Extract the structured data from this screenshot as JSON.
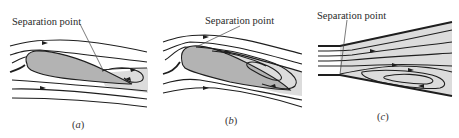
{
  "figure": {
    "panels": [
      {
        "id": "a",
        "annotation": "Separation point",
        "caption_open": "(",
        "caption_letter": "a",
        "caption_close": ")"
      },
      {
        "id": "b",
        "annotation": "Separation point",
        "caption_open": "(",
        "caption_letter": "b",
        "caption_close": ")"
      },
      {
        "id": "c",
        "annotation": "Separation point",
        "caption_open": "(",
        "caption_letter": "c",
        "caption_close": ")"
      }
    ],
    "colors": {
      "streamline": "#1e1e1e",
      "body_fill": "#b3b3b3",
      "wake_fill": "#dcdcdc",
      "background": "#ffffff"
    }
  }
}
